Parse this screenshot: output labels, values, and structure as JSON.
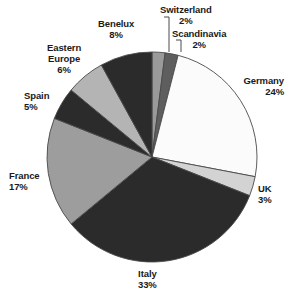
{
  "chart_data": {
    "type": "pie",
    "title": "",
    "subtitle": "",
    "xlabel": "",
    "ylabel": "",
    "legend_position": "none",
    "grid": false,
    "value_unit": "%",
    "start_angle_deg": 0,
    "direction": "clockwise",
    "categories": [
      "Switzerland",
      "Scandinavia",
      "Germany",
      "UK",
      "Italy",
      "France",
      "Spain",
      "Eastern Europe",
      "Benelux"
    ],
    "values": [
      2,
      2,
      24,
      3,
      33,
      17,
      5,
      6,
      8
    ],
    "total": 100,
    "slices": [
      {
        "label": "Switzerland",
        "value": 2,
        "value_text": "2%",
        "color": "#9a9a9a",
        "name_lines": [
          "Switzerland"
        ],
        "value_line": "2%",
        "leader": true
      },
      {
        "label": "Scandinavia",
        "value": 2,
        "value_text": "2%",
        "color": "#5e5e5e",
        "name_lines": [
          "Scandinavia"
        ],
        "value_line": "2%",
        "leader": true
      },
      {
        "label": "Germany",
        "value": 24,
        "value_text": "24%",
        "color": "#fbfbfb",
        "name_lines": [
          "Germany"
        ],
        "value_line": "24%",
        "leader": false
      },
      {
        "label": "UK",
        "value": 3,
        "value_text": "3%",
        "color": "#d3d3d3",
        "name_lines": [
          "UK"
        ],
        "value_line": "3%",
        "leader": false
      },
      {
        "label": "Italy",
        "value": 33,
        "value_text": "33%",
        "color": "#2b2b2b",
        "name_lines": [
          "Italy"
        ],
        "value_line": "33%",
        "leader": false
      },
      {
        "label": "France",
        "value": 17,
        "value_text": "17%",
        "color": "#9d9d9d",
        "name_lines": [
          "France"
        ],
        "value_line": "17%",
        "leader": false
      },
      {
        "label": "Spain",
        "value": 5,
        "value_text": "5%",
        "color": "#2b2b2b",
        "name_lines": [
          "Spain"
        ],
        "value_line": "5%",
        "leader": false
      },
      {
        "label": "Eastern Europe",
        "value": 6,
        "value_text": "6%",
        "color": "#b4b4b4",
        "name_lines": [
          "Eastern",
          "Europe"
        ],
        "value_line": "6%",
        "leader": false
      },
      {
        "label": "Benelux",
        "value": 8,
        "value_text": "8%",
        "color": "#2b2b2b",
        "name_lines": [
          "Benelux"
        ],
        "value_line": "8%",
        "leader": false
      }
    ]
  },
  "labels": {
    "switzerland": {
      "name": "Switzerland",
      "value": "2%"
    },
    "scandinavia": {
      "name": "Scandinavia",
      "value": "2%"
    },
    "germany": {
      "name": "Germany",
      "value": "24%"
    },
    "uk": {
      "name": "UK",
      "value": "3%"
    },
    "italy": {
      "name": "Italy",
      "value": "33%"
    },
    "france": {
      "name": "France",
      "value": "17%"
    },
    "spain": {
      "name": "Spain",
      "value": "5%"
    },
    "eastern_europe": {
      "name1": "Eastern",
      "name2": "Europe",
      "value": "6%"
    },
    "benelux": {
      "name": "Benelux",
      "value": "8%"
    }
  },
  "style": {
    "outline_color": "#4a4a4a",
    "text_color": "#1a1a1a",
    "background": "#ffffff"
  }
}
